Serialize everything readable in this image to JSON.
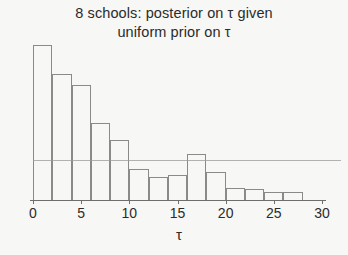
{
  "chart_data": {
    "type": "bar",
    "title": "8 schools:  posterior on τ given uniform prior on τ",
    "title_lines": [
      "8 schools:  posterior on τ given",
      "uniform prior on τ"
    ],
    "xlabel": "τ",
    "ylabel": "",
    "xlim": [
      0,
      30
    ],
    "ylim": [
      0,
      1.0
    ],
    "grid": false,
    "legend": null,
    "bin_width": 2,
    "bin_edges": [
      0,
      2,
      4,
      6,
      8,
      10,
      12,
      14,
      16,
      18,
      20,
      22,
      24,
      26,
      28
    ],
    "categories": [
      "0-2",
      "2-4",
      "4-6",
      "6-8",
      "8-10",
      "10-12",
      "12-14",
      "14-16",
      "16-18",
      "18-20",
      "20-22",
      "22-24",
      "24-26",
      "26-28"
    ],
    "values": [
      1.0,
      0.81,
      0.74,
      0.5,
      0.39,
      0.2,
      0.15,
      0.16,
      0.3,
      0.18,
      0.08,
      0.07,
      0.05,
      0.05
    ],
    "xticks": [
      0,
      5,
      10,
      15,
      20,
      25,
      30
    ],
    "xticklabels": [
      "0",
      "5",
      "10",
      "15",
      "20",
      "25",
      "30"
    ],
    "annotations": [
      {
        "name": "horizontal-rule",
        "y": 0.26,
        "note": "faint horizontal line across figure"
      }
    ],
    "colors": {
      "background": "#f7f7f5",
      "bar_edge": "#8a8a8a",
      "bar_fill": "transparent",
      "axis": "#6e6e6e",
      "text": "#2b2b2b"
    }
  }
}
